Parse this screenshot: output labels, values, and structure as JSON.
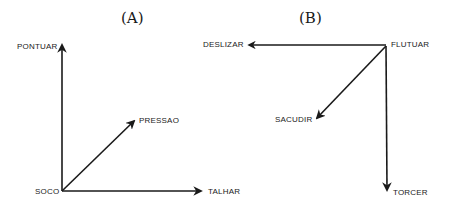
{
  "panels": [
    {
      "id": "A",
      "title": "(A)",
      "origin": "SOCO",
      "labels": {
        "up": "PONTUAR",
        "diagonal": "PRESSAO",
        "origin": "SOCO",
        "right": "TALHAR"
      },
      "edges": [
        {
          "from": "SOCO",
          "to": "PONTUAR",
          "direction": "up"
        },
        {
          "from": "SOCO",
          "to": "PRESSAO",
          "direction": "up-right"
        },
        {
          "from": "SOCO",
          "to": "TALHAR",
          "direction": "right"
        }
      ]
    },
    {
      "id": "B",
      "title": "(B)",
      "origin": "FLUTUAR",
      "labels": {
        "left": "DESLIZAR",
        "origin": "FLUTUAR",
        "diagonal": "SACUDIR",
        "down": "TORCER"
      },
      "edges": [
        {
          "from": "FLUTUAR",
          "to": "DESLIZAR",
          "direction": "left"
        },
        {
          "from": "FLUTUAR",
          "to": "SACUDIR",
          "direction": "down-left"
        },
        {
          "from": "FLUTUAR",
          "to": "TORCER",
          "direction": "down"
        }
      ]
    }
  ],
  "colors": {
    "ink": "#1a1a1a",
    "background": "#ffffff"
  }
}
